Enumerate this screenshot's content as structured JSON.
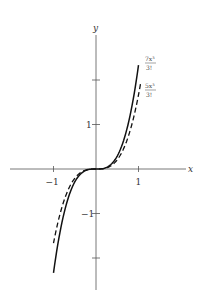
{
  "chart_data": {
    "type": "line",
    "title": "",
    "xlabel": "x",
    "ylabel": "y",
    "xlim": [
      -1.3,
      1.7
    ],
    "ylim": [
      -2.8,
      3.0
    ],
    "grid": false,
    "x_ticks": [
      {
        "value": -1,
        "label": "−1"
      },
      {
        "value": 1,
        "label": "1"
      }
    ],
    "y_ticks": [
      {
        "value": 2,
        "label": ""
      },
      {
        "value": 1,
        "label": "1"
      },
      {
        "value": -1,
        "label": "−1"
      },
      {
        "value": -2,
        "label": ""
      }
    ],
    "series": [
      {
        "name": "7x³/3!",
        "label_num": "7x³",
        "label_den": "3!",
        "style": "solid",
        "coef": 2.3333,
        "x_range": [
          -1.0,
          1.0
        ]
      },
      {
        "name": "5x³/3!",
        "label_num": "5x³",
        "label_den": "3!",
        "style": "dashed",
        "coef": 1.6667,
        "x_range": [
          -1.0,
          1.05
        ]
      }
    ]
  },
  "colors": {
    "axis": "#555555",
    "curve": "#111111"
  }
}
